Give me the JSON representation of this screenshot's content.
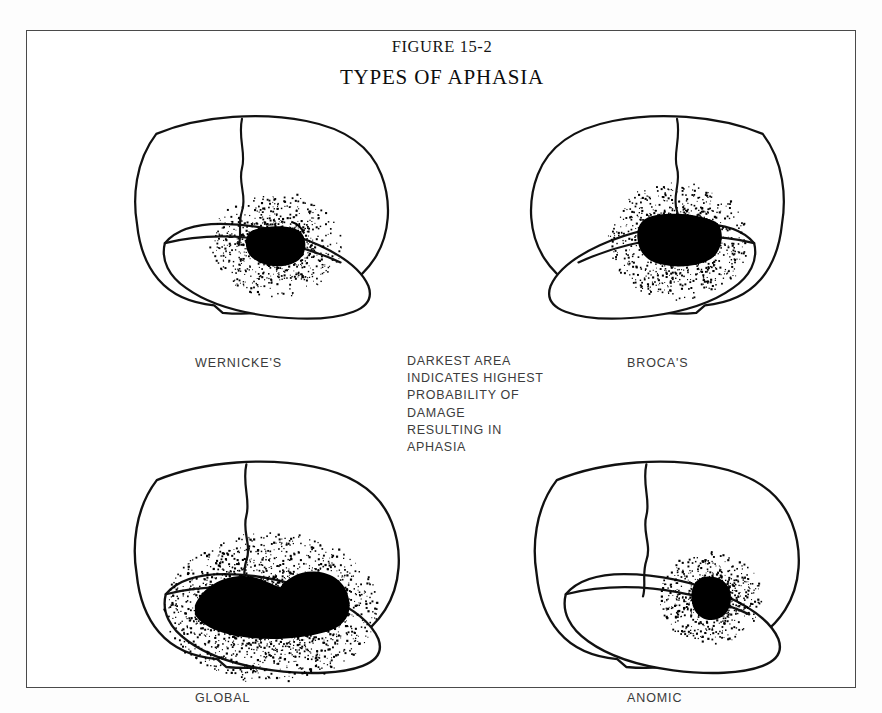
{
  "figure": {
    "number": "FIGURE 15-2",
    "title": "TYPES OF APHASIA",
    "legend_note": "DARKEST AREA\nINDICATES HIGHEST\nPROBABILITY OF\nDAMAGE\nRESULTING IN\nAPHASIA",
    "frame_color": "#4a4a4a",
    "ink_color": "#000000",
    "background_color": "#ffffff"
  },
  "panels": [
    {
      "id": "wernickes",
      "label": "WERNICKE'S",
      "orientation": "facing-left",
      "lesion_region": "posterior-superior-temporal",
      "lesion_size": "small-wedge",
      "position": {
        "left": 70,
        "top": 75,
        "width": 320,
        "height": 225
      },
      "label_position": {
        "left": 168,
        "top": 325
      }
    },
    {
      "id": "brocas",
      "label": "BROCA'S",
      "orientation": "facing-right",
      "lesion_region": "inferior-frontal",
      "lesion_size": "medium-block",
      "position": {
        "left": 470,
        "top": 75,
        "width": 330,
        "height": 225
      },
      "label_position": {
        "left": 600,
        "top": 325
      }
    },
    {
      "id": "global",
      "label": "GLOBAL",
      "orientation": "facing-left",
      "lesion_region": "perisylvian-frontal-to-temporal",
      "lesion_size": "large-irregular",
      "position": {
        "left": 70,
        "top": 420,
        "width": 330,
        "height": 235
      },
      "label_position": {
        "left": 168,
        "top": 660
      }
    },
    {
      "id": "anomic",
      "label": "ANOMIC",
      "orientation": "facing-left",
      "lesion_region": "angular-gyrus",
      "lesion_size": "small-oval",
      "position": {
        "left": 470,
        "top": 420,
        "width": 330,
        "height": 235
      },
      "label_position": {
        "left": 600,
        "top": 660
      }
    }
  ],
  "stipple": {
    "description": "dot density decreasing radially outward from the darkest lesion core",
    "dot_color": "#000000"
  }
}
